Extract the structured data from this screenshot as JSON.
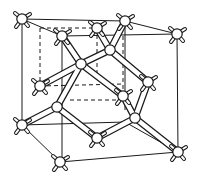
{
  "figure": {
    "title": "Diamond cubic crystal structure",
    "colors": {
      "ink": "#1a1a1a",
      "background": "#ffffff",
      "atom_fill": "#ffffff"
    }
  }
}
